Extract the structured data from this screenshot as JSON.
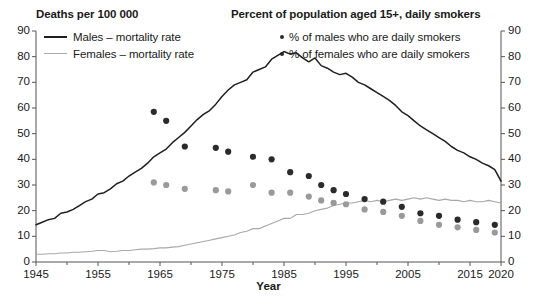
{
  "headers": {
    "left": "Deaths per 100 000",
    "right": "Percent of population aged 15+, daily smokers"
  },
  "legend": {
    "male_line": "Males – mortality rate",
    "female_line": "Females – mortality rate",
    "male_dots": "% of males who are daily smokers",
    "female_dots": "% of females who are daily smokers"
  },
  "colors": {
    "male_line": "#1f1f1f",
    "female_line": "#a8a8a8",
    "male_dots": "#2b2b2b",
    "female_dots": "#9a9a9a",
    "axis": "#555555",
    "background": "#ffffff"
  },
  "chart_data": {
    "type": "line",
    "title": "",
    "xlabel": "Year",
    "ylabel": "Deaths per 100 000",
    "ylabel_right": "Percent of population aged 15+, daily smokers",
    "xlim": [
      1945,
      2020
    ],
    "ylim": [
      0,
      90
    ],
    "ylim_right": [
      0,
      90
    ],
    "ytick_values": [
      0,
      10,
      20,
      30,
      40,
      50,
      60,
      70,
      80,
      90
    ],
    "ytick_labels": [
      "0",
      "10",
      "20",
      "30",
      "40",
      "50",
      "60",
      "70",
      "80",
      "90"
    ],
    "ytick_values_right": [
      0,
      10,
      20,
      30,
      40,
      50,
      60,
      70,
      80,
      90
    ],
    "ytick_labels_right": [
      "0",
      "10",
      "20",
      "30",
      "40",
      "50",
      "60",
      "70",
      "80",
      "90"
    ],
    "xtick_values": [
      1945,
      1955,
      1965,
      1975,
      1985,
      1995,
      2005,
      2015,
      2020
    ],
    "xtick_labels": [
      "1945",
      "1955",
      "1965",
      "1975",
      "1985",
      "1995",
      "2005",
      "2015",
      "2020"
    ],
    "xtick_minor": [
      1950,
      1960,
      1970,
      1980,
      1990,
      2000,
      2010
    ],
    "grid": false,
    "legend_position": "top",
    "series": [
      {
        "name": "Males – mortality rate",
        "type": "line",
        "axis": "left",
        "color": "#1f1f1f",
        "x": [
          1945,
          1946,
          1947,
          1948,
          1949,
          1950,
          1951,
          1952,
          1953,
          1954,
          1955,
          1956,
          1957,
          1958,
          1959,
          1960,
          1961,
          1962,
          1963,
          1964,
          1965,
          1966,
          1967,
          1968,
          1969,
          1970,
          1971,
          1972,
          1973,
          1974,
          1975,
          1976,
          1977,
          1978,
          1979,
          1980,
          1981,
          1982,
          1983,
          1984,
          1985,
          1986,
          1987,
          1988,
          1989,
          1990,
          1991,
          1992,
          1993,
          1994,
          1995,
          1996,
          1997,
          1998,
          1999,
          2000,
          2001,
          2002,
          2003,
          2004,
          2005,
          2006,
          2007,
          2008,
          2009,
          2010,
          2011,
          2012,
          2013,
          2014,
          2015,
          2016,
          2017,
          2018,
          2019,
          2020
        ],
        "y": [
          14.5,
          15.5,
          16.5,
          17.0,
          19.0,
          19.5,
          20.5,
          22.0,
          23.5,
          24.5,
          26.5,
          27.0,
          28.5,
          30.5,
          31.5,
          33.5,
          35.0,
          36.5,
          38.5,
          41.0,
          42.5,
          44.0,
          46.5,
          48.5,
          50.5,
          53.0,
          55.5,
          57.5,
          59.0,
          61.5,
          64.5,
          67.0,
          69.0,
          70.0,
          71.0,
          74.0,
          75.0,
          76.0,
          79.0,
          80.5,
          82.0,
          81.0,
          81.5,
          79.5,
          78.0,
          79.5,
          76.5,
          75.5,
          74.0,
          73.0,
          73.5,
          72.0,
          70.0,
          69.0,
          67.5,
          66.0,
          64.5,
          63.0,
          61.0,
          58.5,
          57.0,
          55.0,
          53.0,
          51.5,
          50.0,
          48.5,
          47.0,
          45.0,
          43.5,
          42.5,
          41.0,
          40.0,
          38.5,
          37.5,
          36.0,
          31.5
        ]
      },
      {
        "name": "Females – mortality rate",
        "type": "line",
        "axis": "left",
        "color": "#a8a8a8",
        "x": [
          1945,
          1946,
          1947,
          1948,
          1949,
          1950,
          1951,
          1952,
          1953,
          1954,
          1955,
          1956,
          1957,
          1958,
          1959,
          1960,
          1961,
          1962,
          1963,
          1964,
          1965,
          1966,
          1967,
          1968,
          1969,
          1970,
          1971,
          1972,
          1973,
          1974,
          1975,
          1976,
          1977,
          1978,
          1979,
          1980,
          1981,
          1982,
          1983,
          1984,
          1985,
          1986,
          1987,
          1988,
          1989,
          1990,
          1991,
          1992,
          1993,
          1994,
          1995,
          1996,
          1997,
          1998,
          1999,
          2000,
          2001,
          2002,
          2003,
          2004,
          2005,
          2006,
          2007,
          2008,
          2009,
          2010,
          2011,
          2012,
          2013,
          2014,
          2015,
          2016,
          2017,
          2018,
          2019,
          2020
        ],
        "y": [
          3.0,
          3.0,
          3.2,
          3.2,
          3.5,
          3.5,
          3.8,
          3.8,
          4.0,
          4.2,
          4.5,
          4.5,
          4.0,
          4.2,
          4.5,
          4.5,
          4.8,
          5.0,
          5.0,
          5.2,
          5.5,
          5.5,
          5.8,
          6.0,
          6.5,
          7.0,
          7.5,
          8.0,
          8.5,
          9.0,
          9.5,
          10.0,
          10.5,
          11.5,
          12.0,
          13.0,
          13.0,
          14.0,
          15.0,
          16.0,
          17.0,
          17.0,
          18.5,
          18.5,
          19.0,
          20.0,
          20.5,
          21.0,
          22.0,
          22.5,
          23.0,
          23.0,
          23.5,
          24.0,
          23.5,
          24.0,
          23.5,
          24.0,
          24.5,
          24.0,
          24.5,
          25.0,
          24.5,
          25.0,
          24.5,
          24.0,
          24.5,
          24.0,
          24.0,
          23.5,
          24.0,
          23.5,
          23.5,
          24.0,
          23.5,
          23.0
        ]
      },
      {
        "name": "% of males who are daily smokers",
        "type": "scatter",
        "axis": "right",
        "color": "#2b2b2b",
        "x": [
          1964,
          1966,
          1969,
          1974,
          1976,
          1980,
          1983,
          1986,
          1989,
          1991,
          1993,
          1995,
          1998,
          2001,
          2004,
          2007,
          2010,
          2013,
          2016,
          2019
        ],
        "y": [
          58.5,
          55.0,
          45.0,
          44.5,
          43.0,
          41.0,
          40.0,
          35.0,
          33.5,
          30.0,
          28.0,
          26.5,
          24.5,
          23.5,
          21.5,
          19.0,
          18.0,
          16.5,
          15.5,
          14.5
        ]
      },
      {
        "name": "% of females who are daily smokers",
        "type": "scatter",
        "axis": "right",
        "color": "#9a9a9a",
        "x": [
          1964,
          1966,
          1969,
          1974,
          1976,
          1980,
          1983,
          1986,
          1989,
          1991,
          1993,
          1995,
          1998,
          2001,
          2004,
          2007,
          2010,
          2013,
          2016,
          2019
        ],
        "y": [
          31.0,
          30.0,
          28.5,
          28.0,
          27.5,
          30.0,
          27.0,
          27.0,
          25.5,
          24.0,
          23.0,
          22.5,
          20.5,
          19.5,
          18.0,
          16.0,
          14.5,
          13.5,
          12.5,
          11.5
        ]
      }
    ]
  },
  "x_title": "Year"
}
